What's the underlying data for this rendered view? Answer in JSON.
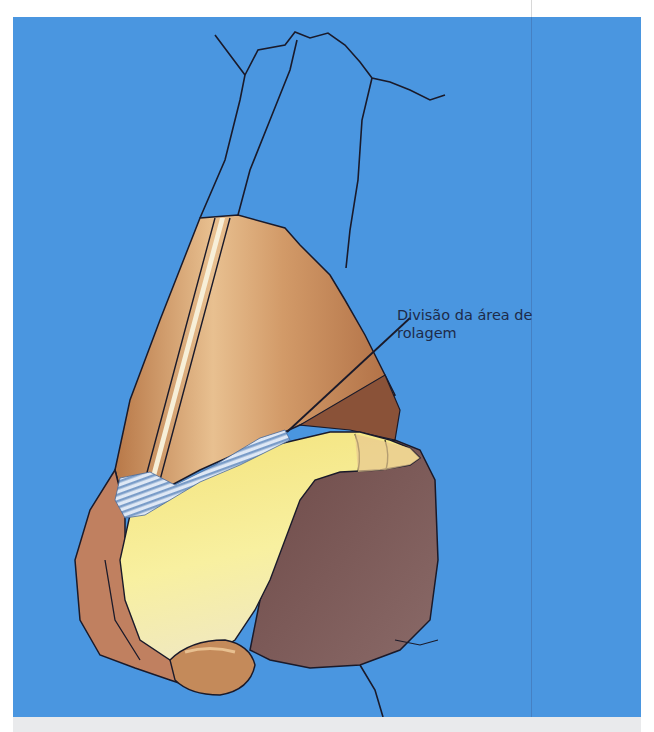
{
  "figure": {
    "background_color": "#4a96e0",
    "annotation": {
      "lines": [
        "Divisão da área de",
        "rolagem"
      ],
      "text_color": "#1d2b4a"
    },
    "colors": {
      "skin_light": "#e0b080",
      "skin_mid": "#c48a5a",
      "skin_dark": "#8a5238",
      "cartilage_yellow": "#f5ec8a",
      "scroll_area_blue": "#c8d8f0",
      "ala_shadow": "#7a5a5a",
      "outline": "#1a1a2a"
    }
  }
}
